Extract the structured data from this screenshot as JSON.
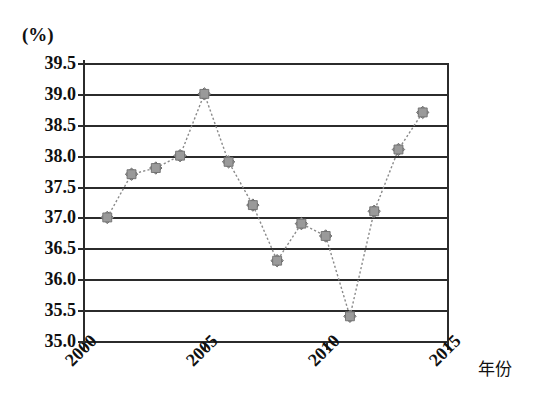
{
  "chart_data": {
    "type": "line",
    "title": "",
    "subtitle": "",
    "xlabel": "年份",
    "ylabel": "(%)",
    "unit_label": "(%)",
    "grid": true,
    "legend": "none",
    "marker": "diamond",
    "line_style": "dotted",
    "series_color": "#8a8a8a",
    "axis_color": "#2b2b2b",
    "xlim": [
      2000,
      2015
    ],
    "ylim": [
      35.0,
      39.5
    ],
    "x_tick_labels": [
      "2000",
      "2005",
      "2010",
      "2015"
    ],
    "x_tick_values": [
      2000,
      2005,
      2010,
      2015
    ],
    "y_tick_labels": [
      "35.0",
      "35.5",
      "36.0",
      "36.5",
      "37.0",
      "37.5",
      "38.0",
      "38.5",
      "39.0",
      "39.5"
    ],
    "y_tick_values": [
      35.0,
      35.5,
      36.0,
      36.5,
      37.0,
      37.5,
      38.0,
      38.5,
      39.0,
      39.5
    ],
    "x": [
      2001,
      2002,
      2003,
      2004,
      2005,
      2006,
      2007,
      2008,
      2009,
      2010,
      2011,
      2012,
      2013,
      2014
    ],
    "values": [
      37.0,
      37.7,
      37.8,
      38.0,
      39.0,
      37.9,
      37.2,
      36.3,
      36.9,
      36.7,
      35.4,
      37.1,
      38.1,
      38.7
    ],
    "points": [
      {
        "year": 2001,
        "value": 37.0
      },
      {
        "year": 2002,
        "value": 37.7
      },
      {
        "year": 2003,
        "value": 37.8
      },
      {
        "year": 2004,
        "value": 38.0
      },
      {
        "year": 2005,
        "value": 39.0
      },
      {
        "year": 2006,
        "value": 37.9
      },
      {
        "year": 2007,
        "value": 37.2
      },
      {
        "year": 2008,
        "value": 36.3
      },
      {
        "year": 2009,
        "value": 36.9
      },
      {
        "year": 2010,
        "value": 36.7
      },
      {
        "year": 2011,
        "value": 35.4
      },
      {
        "year": 2012,
        "value": 37.1
      },
      {
        "year": 2013,
        "value": 38.1
      },
      {
        "year": 2014,
        "value": 38.7
      }
    ]
  }
}
